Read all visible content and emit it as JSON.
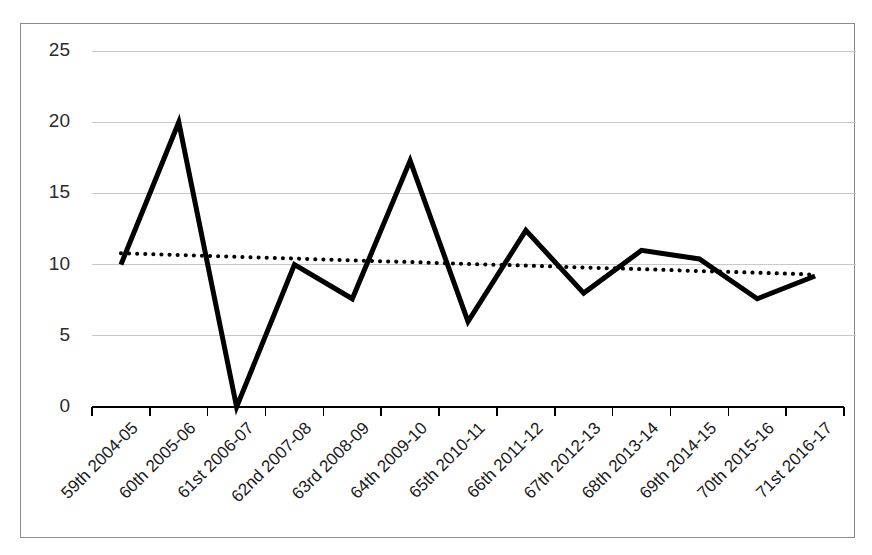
{
  "chart_data": {
    "type": "line",
    "title": "",
    "subtitle": "",
    "xlabel": "",
    "ylabel": "",
    "ylim": [
      0,
      25
    ],
    "yticks": [
      0,
      5,
      10,
      15,
      20,
      25
    ],
    "ytick_labels": [
      "0",
      "5",
      "10",
      "15",
      "20",
      "25"
    ],
    "grid": true,
    "legend": "none",
    "categories": [
      "59th 2004-05",
      "60th 2005-06",
      "61st 2006-07",
      "62nd 2007-08",
      "63rd 2008-09",
      "64th 2009-10",
      "65th 2010-11",
      "66th 2011-12",
      "67th 2012-13",
      "68th 2013-14",
      "69th 2014-15",
      "70th 2015-16",
      "71st 2016-17"
    ],
    "series": [
      {
        "name": "value",
        "style": "solid",
        "color": "#000000",
        "values": [
          10,
          20,
          0,
          10,
          7.6,
          17.3,
          6,
          12.4,
          8,
          11,
          10.4,
          7.6,
          9.2
        ]
      },
      {
        "name": "linear-trendline",
        "style": "dotted",
        "color": "#000000",
        "values": [
          10.8,
          10.68,
          10.55,
          10.43,
          10.3,
          10.18,
          10.05,
          9.93,
          9.8,
          9.68,
          9.55,
          9.43,
          9.3
        ]
      }
    ],
    "xtick_label_rotation": -45
  },
  "frame": {
    "border_color": "#8c8c8c",
    "background": "#ffffff",
    "gridline_color": "#c8c8c8",
    "axis_color": "#000000"
  }
}
